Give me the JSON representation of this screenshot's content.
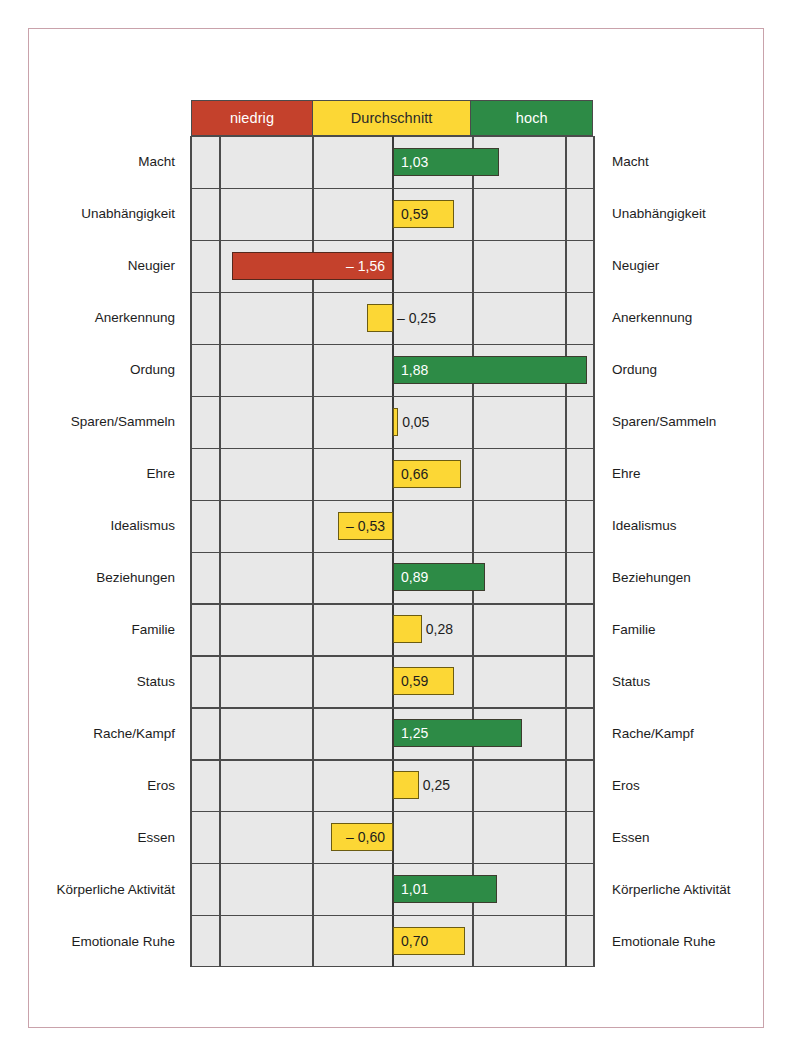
{
  "chart_data": {
    "type": "bar",
    "title": "",
    "subtitle": "",
    "xlabel": "",
    "ylabel": "",
    "orientation": "horizontal",
    "grid": true,
    "legend_position": "top",
    "xlim": [
      -2.0,
      2.0
    ],
    "zero_line": 0,
    "value_format": "german-decimal-comma",
    "legend": [
      {
        "key": "low",
        "label": "niedrig",
        "color": "#c4412c"
      },
      {
        "key": "mid",
        "label": "Durchschnitt",
        "color": "#fcd735"
      },
      {
        "key": "high",
        "label": "hoch",
        "color": "#2d8b46"
      }
    ],
    "categories": [
      "Macht",
      "Unabhängigkeit",
      "Neugier",
      "Anerkennung",
      "Ordung",
      "Sparen/Sammeln",
      "Ehre",
      "Idealismus",
      "Beziehungen",
      "Familie",
      "Status",
      "Rache/Kampf",
      "Eros",
      "Essen",
      "Körperliche Aktivität",
      "Emotionale Ruhe"
    ],
    "values": [
      1.03,
      0.59,
      -1.56,
      -0.25,
      1.88,
      0.05,
      0.66,
      -0.53,
      0.89,
      0.28,
      0.59,
      1.25,
      0.25,
      -0.6,
      1.01,
      0.7
    ],
    "bars": [
      {
        "label": "Macht",
        "value": 1.03,
        "text": "1,03",
        "color": "high",
        "label_inside": true
      },
      {
        "label": "Unabhängigkeit",
        "value": 0.59,
        "text": "0,59",
        "color": "mid",
        "label_inside": true
      },
      {
        "label": "Neugier",
        "value": -1.56,
        "text": "– 1,56",
        "color": "low",
        "label_inside": true
      },
      {
        "label": "Anerkennung",
        "value": -0.25,
        "text": "– 0,25",
        "color": "mid",
        "label_inside": false
      },
      {
        "label": "Ordung",
        "value": 1.88,
        "text": "1,88",
        "color": "high",
        "label_inside": true
      },
      {
        "label": "Sparen/Sammeln",
        "value": 0.05,
        "text": "0,05",
        "color": "mid",
        "label_inside": false
      },
      {
        "label": "Ehre",
        "value": 0.66,
        "text": "0,66",
        "color": "mid",
        "label_inside": true
      },
      {
        "label": "Idealismus",
        "value": -0.53,
        "text": "– 0,53",
        "color": "mid",
        "label_inside": true
      },
      {
        "label": "Beziehungen",
        "value": 0.89,
        "text": "0,89",
        "color": "high",
        "label_inside": true
      },
      {
        "label": "Familie",
        "value": 0.28,
        "text": "0,28",
        "color": "mid",
        "label_inside": false
      },
      {
        "label": "Status",
        "value": 0.59,
        "text": "0,59",
        "color": "mid",
        "label_inside": true
      },
      {
        "label": "Rache/Kampf",
        "value": 1.25,
        "text": "1,25",
        "color": "high",
        "label_inside": true
      },
      {
        "label": "Eros",
        "value": 0.25,
        "text": "0,25",
        "color": "mid",
        "label_inside": false
      },
      {
        "label": "Essen",
        "value": -0.6,
        "text": "– 0,60",
        "color": "mid",
        "label_inside": true
      },
      {
        "label": "Körperliche Aktivität",
        "value": 1.01,
        "text": "1,01",
        "color": "high",
        "label_inside": true
      },
      {
        "label": "Emotionale Ruhe",
        "value": 0.7,
        "text": "0,70",
        "color": "mid",
        "label_inside": true
      }
    ]
  },
  "colors": {
    "low": "#c4412c",
    "mid": "#fcd735",
    "high": "#2d8b46",
    "plot_background": "#e8e8e8",
    "grid_line": "#4b4b4b",
    "page_frame": "#c9a2ab",
    "text": "#1d1d1d"
  }
}
